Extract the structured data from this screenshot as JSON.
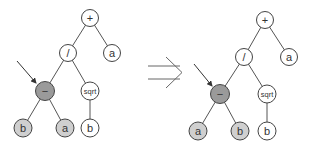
{
  "diagram": {
    "type": "expression-tree-transformation",
    "colors": {
      "node_white": "#ffffff",
      "node_leaf_gray": "#cfcfcf",
      "node_selected": "#9a9a9a",
      "edge": "#555555"
    },
    "transform_symbol": "⇒",
    "trees": [
      {
        "name": "before",
        "nodes": [
          {
            "id": "plus",
            "label": "+",
            "style": "white"
          },
          {
            "id": "div",
            "label": "/",
            "style": "white"
          },
          {
            "id": "a_top",
            "label": "a",
            "style": "white"
          },
          {
            "id": "minus",
            "label": "−",
            "style": "selected"
          },
          {
            "id": "sqrt",
            "label": "sqrt",
            "style": "white"
          },
          {
            "id": "minus_left",
            "label": "b",
            "style": "gray"
          },
          {
            "id": "minus_right",
            "label": "a",
            "style": "gray"
          },
          {
            "id": "sqrt_child",
            "label": "b",
            "style": "white"
          }
        ],
        "pointer": "minus"
      },
      {
        "name": "after",
        "nodes": [
          {
            "id": "plus",
            "label": "+",
            "style": "white"
          },
          {
            "id": "div",
            "label": "/",
            "style": "white"
          },
          {
            "id": "a_top",
            "label": "a",
            "style": "white"
          },
          {
            "id": "minus",
            "label": "−",
            "style": "selected"
          },
          {
            "id": "sqrt",
            "label": "sqrt",
            "style": "white"
          },
          {
            "id": "minus_left",
            "label": "a",
            "style": "gray"
          },
          {
            "id": "minus_right",
            "label": "b",
            "style": "gray"
          },
          {
            "id": "sqrt_child",
            "label": "b",
            "style": "white"
          }
        ],
        "pointer": "minus"
      }
    ]
  }
}
